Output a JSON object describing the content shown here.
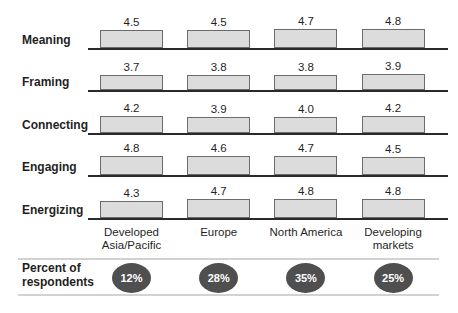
{
  "chart_data": {
    "type": "bar",
    "categories": [
      "Developed Asia/Pacific",
      "Europe",
      "North America",
      "Developing markets"
    ],
    "rows": [
      {
        "label": "Meaning",
        "values": [
          4.5,
          4.5,
          4.7,
          4.8
        ]
      },
      {
        "label": "Framing",
        "values": [
          3.7,
          3.8,
          3.8,
          3.9
        ]
      },
      {
        "label": "Connecting",
        "values": [
          4.2,
          3.9,
          4.0,
          4.2
        ]
      },
      {
        "label": "Engaging",
        "values": [
          4.8,
          4.6,
          4.7,
          4.5
        ]
      },
      {
        "label": "Energizing",
        "values": [
          4.3,
          4.7,
          4.8,
          4.8
        ]
      }
    ],
    "footer": {
      "label": "Percent of respondents",
      "values": [
        "12%",
        "28%",
        "35%",
        "25%"
      ]
    },
    "legend_position": "none",
    "grid": false
  },
  "colors": {
    "bar_fill": "#dcdcdc",
    "bar_border": "#6b6b6b",
    "baseline": "#2a2a2a",
    "oval_fill": "#4f4f4f",
    "oval_text": "#ffffff",
    "divider": "#d2d2d2",
    "text": "#1f1f1f"
  }
}
